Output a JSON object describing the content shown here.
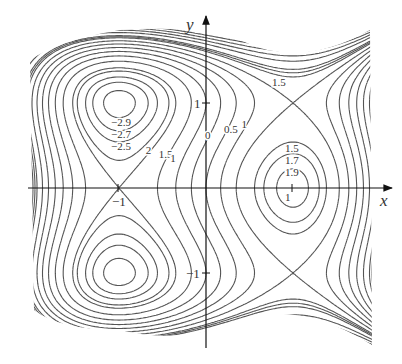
{
  "chart_data": {
    "type": "contour",
    "title": "",
    "xlabel": "x",
    "ylabel": "y",
    "function_estimate": "f(x,y) = 3x - x^3 + y^4 - 2y^2",
    "xlim": [
      -2.1,
      2.15
    ],
    "ylim": [
      -1.85,
      2.0
    ],
    "grid": false,
    "legend": null,
    "x_ticks": [
      {
        "value": -1,
        "label": "-1"
      },
      {
        "value": 1,
        "label": "1"
      }
    ],
    "y_ticks": [
      {
        "value": 1,
        "label": "1"
      },
      {
        "value": -1,
        "label": "-1"
      }
    ],
    "levels": [
      -2.9,
      -2.7,
      -2.5,
      -2.2,
      -2,
      -1.5,
      -1,
      -0.5,
      0,
      0.5,
      1,
      1.5,
      1.7,
      1.9,
      2.5,
      3,
      3.5,
      4,
      5,
      6
    ],
    "critical_points": [
      {
        "type": "min",
        "x": -1,
        "y": 1,
        "value": -3
      },
      {
        "type": "min",
        "x": -1,
        "y": -1,
        "value": -3
      },
      {
        "type": "saddle",
        "x": -1,
        "y": 0,
        "value": -2
      },
      {
        "type": "max",
        "x": 1,
        "y": 0,
        "value": 2
      },
      {
        "type": "saddle",
        "x": 1,
        "y": 1,
        "value": 1
      },
      {
        "type": "saddle",
        "x": 1,
        "y": -1,
        "value": 1
      }
    ],
    "contour_labels": [
      {
        "text": "-2.9",
        "x": -1.0,
        "y": 0.78
      },
      {
        "text": "-2.7",
        "x": -1.0,
        "y": 0.64
      },
      {
        "text": "-2.5",
        "x": -1.0,
        "y": 0.5
      },
      {
        "text": "2",
        "x": -0.6,
        "y": 0.45
      },
      {
        "text": "1.5",
        "x": -0.45,
        "y": 0.4
      },
      {
        "text": "1",
        "x": -0.32,
        "y": 0.35
      },
      {
        "text": "0",
        "x": 0.08,
        "y": 0.62
      },
      {
        "text": "0.5",
        "x": 0.3,
        "y": 0.7
      },
      {
        "text": "1",
        "x": 0.5,
        "y": 0.75
      },
      {
        "text": "1.5",
        "x": 0.85,
        "y": 1.25
      },
      {
        "text": "1.5",
        "x": 1.0,
        "y": 0.47
      },
      {
        "text": "1.7",
        "x": 1.0,
        "y": 0.33
      },
      {
        "text": "1.9",
        "x": 1.0,
        "y": 0.19
      },
      {
        "text": "1",
        "x": 1.0,
        "y": -0.1
      }
    ]
  },
  "axes": {
    "x_label": "x",
    "y_label": "y",
    "tick_x_neg1": "−1",
    "tick_y_pos1": "1",
    "tick_y_neg1": "−1"
  },
  "colors": {
    "contour": "#555555",
    "axis": "#111111",
    "background": "#ffffff"
  }
}
